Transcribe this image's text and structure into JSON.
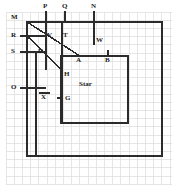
{
  "figure": {
    "title": "Star",
    "width": 176,
    "height": 195,
    "background_color": "#ffffff",
    "grid": {
      "color": "#d8d8d8",
      "cell_size": 8.2,
      "x_start": 6,
      "y_start": 12,
      "x_end": 172,
      "y_end": 185,
      "visible": true
    },
    "stroke_color": "#2b2b2b",
    "labels": [
      {
        "id": "M",
        "text": "M",
        "x": 14,
        "y": 17
      },
      {
        "id": "P",
        "text": "P",
        "x": 46,
        "y": 7
      },
      {
        "id": "Q",
        "text": "Q",
        "x": 65,
        "y": 7
      },
      {
        "id": "N",
        "text": "N",
        "x": 93,
        "y": 7
      },
      {
        "id": "R",
        "text": "R",
        "x": 14,
        "y": 38
      },
      {
        "id": "V",
        "text": "V",
        "x": 48,
        "y": 36
      },
      {
        "id": "T",
        "text": "T",
        "x": 63,
        "y": 36
      },
      {
        "id": "W",
        "text": "W",
        "x": 97,
        "y": 40
      },
      {
        "id": "S",
        "text": "S",
        "x": 14,
        "y": 57
      },
      {
        "id": "U",
        "text": "U",
        "x": 39,
        "y": 55
      },
      {
        "id": "A",
        "text": "A",
        "x": 78,
        "y": 60
      },
      {
        "id": "B",
        "text": "B",
        "x": 106,
        "y": 60
      },
      {
        "id": "H",
        "text": "H",
        "x": 65,
        "y": 74
      },
      {
        "id": "O",
        "text": "O",
        "x": 14,
        "y": 89
      },
      {
        "id": "X",
        "text": "X",
        "x": 41,
        "y": 97
      },
      {
        "id": "G",
        "text": "G",
        "x": 66,
        "y": 100
      },
      {
        "id": "Star",
        "text": "Star",
        "x": 79,
        "y": 85
      }
    ],
    "shapes": {
      "outer_rect": {
        "name": "outer-boundary-rect",
        "x1": 27,
        "y1": 22,
        "x2": 162,
        "y2": 156
      },
      "inner_rect": {
        "name": "star-region-rect",
        "x1": 61,
        "y1": 56,
        "x2": 128,
        "y2": 123
      },
      "diagonal_main": {
        "name": "diagonal-M-to-A",
        "x1": 27,
        "y1": 22,
        "x2": 79,
        "y2": 56
      },
      "diagonal_lower": {
        "name": "diagonal-R-to-H",
        "x1": 27,
        "y1": 36,
        "x2": 62,
        "y2": 70
      },
      "vert_V": {
        "name": "vertical-line-V",
        "x1": 46,
        "y1": 22,
        "x2": 46,
        "y2": 70
      },
      "vert_T": {
        "name": "vertical-line-T",
        "x1": 62,
        "y1": 22,
        "x2": 62,
        "y2": 123
      },
      "vert_U": {
        "name": "vertical-line-U",
        "x1": 36,
        "y1": 52,
        "x2": 36,
        "y2": 156
      },
      "horiz_R": {
        "name": "horizontal-line-R",
        "x1": 20,
        "y1": 36,
        "x2": 46,
        "y2": 36
      },
      "horiz_S": {
        "name": "horizontal-line-S",
        "x1": 20,
        "y1": 52,
        "x2": 46,
        "y2": 52
      },
      "horiz_O": {
        "name": "horizontal-line-O",
        "x1": 20,
        "y1": 88,
        "x2": 46,
        "y2": 88
      },
      "tick_P": {
        "name": "tick-line-P",
        "x1": 46,
        "y1": 11,
        "x2": 46,
        "y2": 22
      },
      "tick_Q": {
        "name": "tick-line-Q",
        "x1": 65,
        "y1": 11,
        "x2": 65,
        "y2": 22
      },
      "tick_N": {
        "name": "tick-line-N",
        "x1": 94,
        "y1": 11,
        "x2": 94,
        "y2": 45
      },
      "tick_B": {
        "name": "tick-line-B",
        "x1": 108,
        "y1": 51,
        "x2": 108,
        "y2": 56
      },
      "tick_G": {
        "name": "tick-line-G",
        "x1": 58,
        "y1": 98,
        "x2": 63,
        "y2": 98
      },
      "tick_X": {
        "name": "tick-line-X",
        "x1": 39,
        "y1": 93,
        "x2": 50,
        "y2": 93
      },
      "seg_A_top": {
        "name": "segment-A-top",
        "x1": 61,
        "y1": 56,
        "x2": 128,
        "y2": 56
      }
    }
  }
}
